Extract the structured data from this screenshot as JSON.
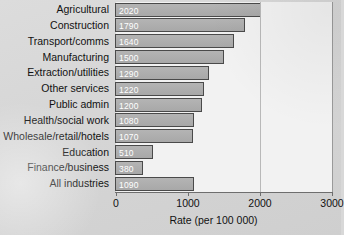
{
  "chart_data": {
    "type": "bar",
    "orientation": "horizontal",
    "title": "",
    "xlabel": "Rate (per 100 000)",
    "ylabel": "",
    "xlim": [
      0,
      3000
    ],
    "xticks": [
      "0",
      "1000",
      "2000",
      "3000"
    ],
    "xtick_values": [
      0,
      1000,
      2000,
      3000
    ],
    "grid": "vertical-gridline-at-2000",
    "legend": "none",
    "categories": [
      "Agricultural",
      "Construction",
      "Transport/comms",
      "Manufacturing",
      "Extraction/utilities",
      "Other services",
      "Public admin",
      "Health/social work",
      "Wholesale/retail/hotels",
      "Education",
      "Finance/business",
      "All industries"
    ],
    "values": [
      2020,
      1790,
      1640,
      1500,
      1290,
      1220,
      1200,
      1080,
      1070,
      510,
      380,
      1090
    ],
    "value_labels": [
      "2020",
      "1790",
      "1640",
      "1500",
      "1290",
      "1220",
      "1200",
      "1080",
      "1070",
      "510",
      "380",
      "1090"
    ],
    "colors": {
      "bar_fill": "#adadad",
      "bar_border": "#4a4a4a",
      "value_label_text": "#ffffff",
      "plot_background": "#f2f2f2",
      "page_background": "#d8d8d8",
      "axis": "#6e6e6e",
      "text": "#111111"
    }
  }
}
